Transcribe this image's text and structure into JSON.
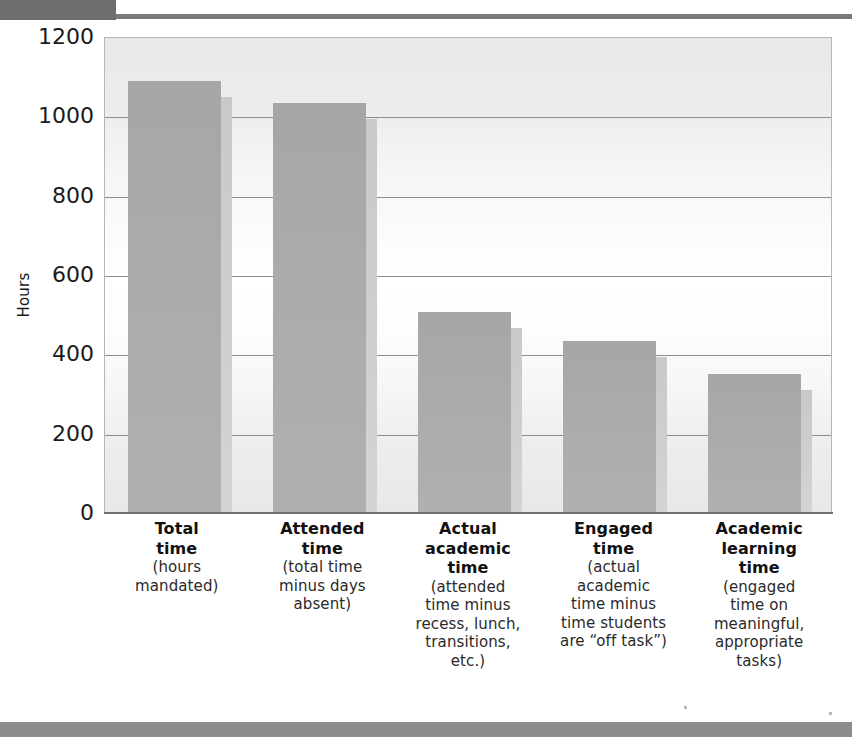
{
  "chart_data": {
    "type": "bar",
    "title": "",
    "xlabel": "",
    "ylabel": "Hours",
    "ylim": [
      0,
      1200
    ],
    "ytick_step": 200,
    "yticks": [
      "1200",
      "1000",
      "800",
      "600",
      "400",
      "200",
      "0"
    ],
    "grid": "horizontal",
    "legend": "none",
    "categories": [
      "Total time",
      "Attended time",
      "Actual academic time",
      "Engaged time",
      "Academic learning time"
    ],
    "values": [
      1086,
      1031,
      503,
      432,
      349
    ],
    "bars": [
      {
        "title": "Total\ntime",
        "subtitle": "(hours\nmandated)",
        "value": 1086
      },
      {
        "title": "Attended\ntime",
        "subtitle": "(total time\nminus days\nabsent)",
        "value": 1031
      },
      {
        "title": "Actual\nacademic\ntime",
        "subtitle": "(attended\ntime minus\nrecess, lunch,\ntransitions,\netc.)",
        "value": 503
      },
      {
        "title": "Engaged\ntime",
        "subtitle": "(actual\nacademic\ntime minus\ntime students\nare “off task”)",
        "value": 432
      },
      {
        "title": "Academic\nlearning\ntime",
        "subtitle": "(engaged\ntime on\nmeaningful,\nappropriate\ntasks)",
        "value": 349
      }
    ],
    "colors": {
      "bar_fill": "#ababab",
      "bar_shadow": "#cfcfcf",
      "gridline": "#8d8d8d",
      "plot_border": "#b6b6b6",
      "axis": "#6f6f6f",
      "text": "#111111",
      "header_tab": "#6e6e6e",
      "footer_bar": "#8c8c8c"
    }
  }
}
